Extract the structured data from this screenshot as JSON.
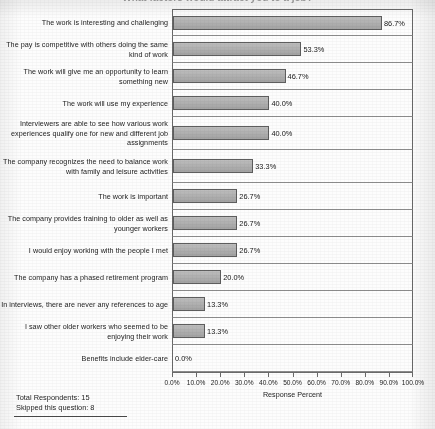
{
  "title": "What factors would attract you to a job?",
  "chart_data": {
    "type": "bar",
    "orientation": "horizontal",
    "title": "What factors would attract you to a job?",
    "xlabel": "Response Percent",
    "ylabel": "",
    "xlim": [
      0,
      100
    ],
    "grid": false,
    "legend": null,
    "value_suffix": "%",
    "categories": [
      "The work is interesting and challenging",
      "The pay is competitive with others doing the same kind of work",
      "The work will give me an opportunity to learn something new",
      "The work will use my experience",
      "Interviewers are able to see how various work experiences qualify one for new and different job assignments",
      "The company recognizes the need to balance work with family and leisure activities",
      "The work is important",
      "The company provides training to older as well as younger workers",
      "I would enjoy working with the people I met",
      "The company has a phased retirement program",
      "In interviews, there are never any references to age",
      "I saw other older workers who seemed to be enjoying their work",
      "Benefits include elder-care"
    ],
    "values": [
      86.7,
      53.3,
      46.7,
      40.0,
      40.0,
      33.3,
      26.7,
      26.7,
      26.7,
      20.0,
      13.3,
      13.3,
      0.0
    ],
    "value_labels": [
      "86.7%",
      "53.3%",
      "46.7%",
      "40.0%",
      "40.0%",
      "33.3%",
      "26.7%",
      "26.7%",
      "26.7%",
      "20.0%",
      "13.3%",
      "13.3%",
      "0.0%"
    ],
    "xticks": [
      0,
      10,
      20,
      30,
      40,
      50,
      60,
      70,
      80,
      90,
      100
    ],
    "xtick_labels": [
      "0.0%",
      "10.0%",
      "20.0%",
      "30.0%",
      "40.0%",
      "50.0%",
      "60.0%",
      "70.0%",
      "80.0%",
      "90.0%",
      "100.0%"
    ],
    "bar_color": "#ababab",
    "bar_border_color": "#5e5e5e"
  },
  "footer": {
    "total_respondents": "Total Respondents: 15",
    "skipped": "Skipped this question: 8"
  }
}
